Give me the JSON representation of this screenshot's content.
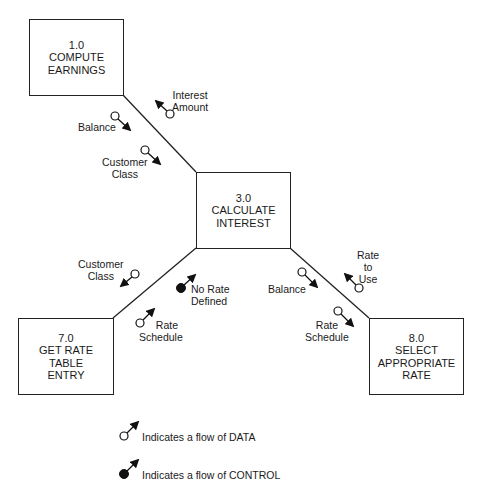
{
  "diagram": {
    "type": "structure-chart",
    "modules": [
      {
        "id": "1.0",
        "lines": [
          "1.0",
          "COMPUTE",
          "EARNINGS"
        ]
      },
      {
        "id": "3.0",
        "lines": [
          "3.0",
          "CALCULATE",
          "INTEREST"
        ]
      },
      {
        "id": "7.0",
        "lines": [
          "7.0",
          "GET RATE",
          "TABLE",
          "ENTRY"
        ]
      },
      {
        "id": "8.0",
        "lines": [
          "8.0",
          "SELECT",
          "APPROPRIATE",
          "RATE"
        ]
      }
    ],
    "connections": [
      {
        "from": "1.0",
        "to": "3.0"
      },
      {
        "from": "3.0",
        "to": "7.0"
      },
      {
        "from": "3.0",
        "to": "8.0"
      }
    ],
    "couples": [
      {
        "label": [
          "Interest",
          "Amount"
        ],
        "kind": "data",
        "direction": "up",
        "between": "3.0-1.0"
      },
      {
        "label": [
          "Balance"
        ],
        "kind": "data",
        "direction": "down",
        "between": "1.0-3.0"
      },
      {
        "label": [
          "Customer",
          "Class"
        ],
        "kind": "data",
        "direction": "down",
        "between": "1.0-3.0"
      },
      {
        "label": [
          "Customer",
          "Class"
        ],
        "kind": "data",
        "direction": "down",
        "between": "3.0-7.0"
      },
      {
        "label": [
          "No Rate",
          "Defined"
        ],
        "kind": "control",
        "direction": "up",
        "between": "7.0-3.0"
      },
      {
        "label": [
          "Rate",
          "Schedule"
        ],
        "kind": "data",
        "direction": "up",
        "between": "7.0-3.0"
      },
      {
        "label": [
          "Balance"
        ],
        "kind": "data",
        "direction": "down",
        "between": "3.0-8.0"
      },
      {
        "label": [
          "Rate",
          "to",
          "Use"
        ],
        "kind": "data",
        "direction": "up",
        "between": "8.0-3.0"
      },
      {
        "label": [
          "Rate",
          "Schedule"
        ],
        "kind": "data",
        "direction": "down",
        "between": "3.0-8.0"
      }
    ],
    "legend": [
      {
        "symbol": "open-circle-arrow",
        "text": "Indicates a flow of DATA"
      },
      {
        "symbol": "filled-circle-arrow",
        "text": "Indicates a flow of CONTROL"
      }
    ]
  }
}
